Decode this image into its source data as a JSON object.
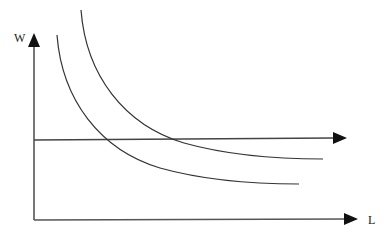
{
  "diagram": {
    "type": "economics-labor-market",
    "axes": {
      "y_label": "W",
      "x_label": "L"
    },
    "colors": {
      "line": "#333333",
      "axis": "#555555",
      "background": "#ffffff"
    },
    "elements": [
      {
        "id": "curve-lower",
        "kind": "convex-curve",
        "start": [
          57,
          35
        ],
        "end": [
          299,
          184
        ]
      },
      {
        "id": "curve-upper",
        "kind": "convex-curve",
        "start": [
          81,
          10
        ],
        "end": [
          323,
          159
        ]
      },
      {
        "id": "wage-line",
        "kind": "horizontal-arrow",
        "y": 140,
        "from_x": 34,
        "to_x": 346
      }
    ]
  }
}
